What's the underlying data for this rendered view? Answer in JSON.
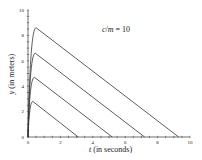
{
  "chart_data": {
    "type": "line",
    "title": "",
    "annotation": "c/m = 10",
    "annotation_parts": {
      "c": "c",
      "slash": "/",
      "m": "m",
      "eq": " = 10"
    },
    "xlabel": "t (in seconds)",
    "xlabel_parts": {
      "var": "t",
      "rest": " (in seconds)"
    },
    "ylabel": "y (in meters)",
    "ylabel_parts": {
      "var": "y",
      "rest": " (in meters)"
    },
    "xlim": [
      0,
      10
    ],
    "ylim": [
      0,
      10
    ],
    "xticks": [
      0,
      2,
      4,
      6,
      8,
      10
    ],
    "yticks": [
      0,
      2,
      4,
      6,
      8,
      10
    ],
    "grid": false,
    "legend": null,
    "series": [
      {
        "name": "curve-1",
        "peak_t": 0.3,
        "peak_y": 2.8,
        "end_t": 3.1,
        "points": [
          [
            0,
            0
          ],
          [
            0.05,
            1.5
          ],
          [
            0.12,
            2.4
          ],
          [
            0.3,
            2.8
          ],
          [
            3.1,
            0
          ]
        ]
      },
      {
        "name": "curve-2",
        "peak_t": 0.4,
        "peak_y": 4.7,
        "end_t": 5.2,
        "points": [
          [
            0,
            0
          ],
          [
            0.06,
            2.5
          ],
          [
            0.15,
            4.0
          ],
          [
            0.4,
            4.7
          ],
          [
            5.2,
            0
          ]
        ]
      },
      {
        "name": "curve-3",
        "peak_t": 0.45,
        "peak_y": 6.6,
        "end_t": 7.2,
        "points": [
          [
            0,
            0
          ],
          [
            0.07,
            3.5
          ],
          [
            0.17,
            5.7
          ],
          [
            0.45,
            6.6
          ],
          [
            7.2,
            0
          ]
        ]
      },
      {
        "name": "curve-4",
        "peak_t": 0.5,
        "peak_y": 8.6,
        "end_t": 9.3,
        "points": [
          [
            0,
            0
          ],
          [
            0.08,
            4.6
          ],
          [
            0.2,
            7.5
          ],
          [
            0.5,
            8.6
          ],
          [
            9.3,
            0
          ]
        ]
      }
    ]
  }
}
